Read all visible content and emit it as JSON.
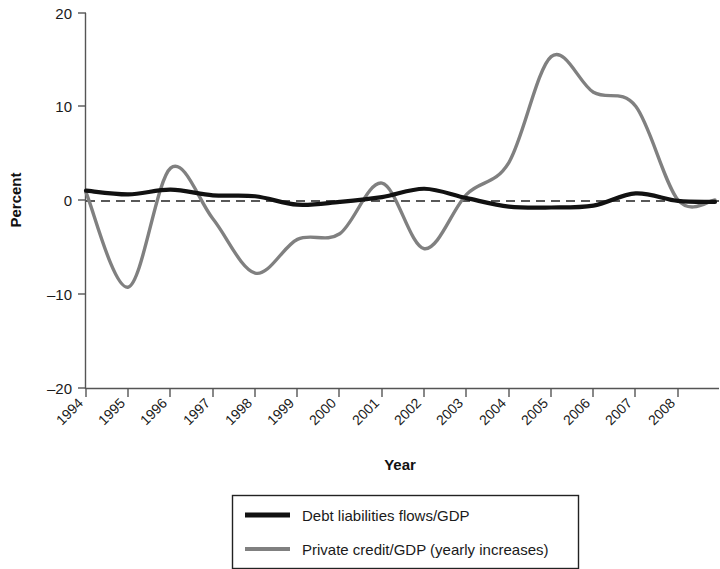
{
  "chart_data": {
    "type": "line",
    "title": "",
    "xlabel": "Year",
    "ylabel": "Percent",
    "xlim": [
      1994,
      2008
    ],
    "ylim": [
      -20,
      20
    ],
    "yticks": [
      20,
      10,
      0,
      -10,
      -20
    ],
    "ytick_labels": [
      "20",
      "10",
      "0",
      "–10",
      "–20"
    ],
    "grid": false,
    "legend_position": "bottom",
    "zero_reference_line": {
      "value": 0,
      "style": "dashed",
      "color": "#222222"
    },
    "categories": [
      "1994",
      "1995",
      "1996",
      "1997",
      "1998",
      "1999",
      "2000",
      "2001",
      "2002",
      "2003",
      "2004",
      "2005",
      "2006",
      "2007",
      "2008"
    ],
    "x": [
      1994,
      1995,
      1996,
      1997,
      1998,
      1999,
      2000,
      2001,
      2002,
      2003,
      2004,
      2005,
      2006,
      2007,
      2008
    ],
    "series": [
      {
        "name": "Debt liabilities flows/GDP",
        "color": "#111111",
        "style": "solid-thick",
        "values": [
          1.0,
          0.6,
          1.1,
          0.5,
          0.4,
          -0.5,
          -0.2,
          0.3,
          1.2,
          0.2,
          -0.7,
          -0.8,
          -0.6,
          0.7,
          -0.1
        ]
      },
      {
        "name": "Private credit/GDP (yearly increases)",
        "color": "#808080",
        "style": "solid-medium",
        "values": [
          0.8,
          -9.3,
          3.4,
          -2.0,
          -7.8,
          -4.2,
          -3.6,
          1.8,
          -5.2,
          0.6,
          4.0,
          15.3,
          11.5,
          10.0,
          0.0
        ]
      }
    ],
    "annotations": []
  },
  "axes": {
    "y_title": "Percent",
    "x_title": "Year",
    "y_tick_labels": [
      "20",
      "10",
      "0",
      "–10",
      "–20"
    ],
    "x_tick_labels": [
      "1994",
      "1995",
      "1996",
      "1997",
      "1998",
      "1999",
      "2000",
      "2001",
      "2002",
      "2003",
      "2004",
      "2005",
      "2006",
      "2007",
      "2008"
    ]
  },
  "legend": {
    "entries": [
      {
        "label": "Debt liabilities flows/GDP",
        "color": "#111111"
      },
      {
        "label": "Private credit/GDP (yearly increases)",
        "color": "#808080"
      }
    ]
  },
  "colors": {
    "series_black": "#111111",
    "series_gray": "#808080",
    "axis": "#555555",
    "background": "#ffffff"
  }
}
